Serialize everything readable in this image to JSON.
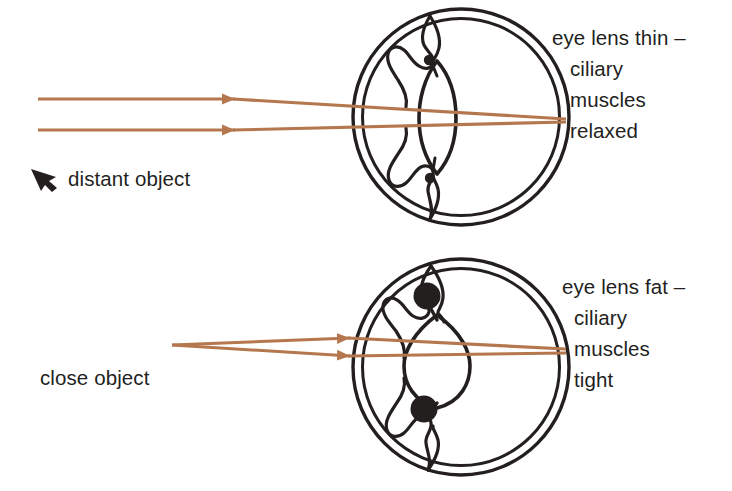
{
  "figure": {
    "background_color": "#ffffff",
    "ink_color": "#231f1e",
    "ray_color": "#b5784e"
  },
  "diagrams": [
    {
      "id": "distant-vision",
      "eye": {
        "center_x": 461,
        "center_y": 117,
        "radius_outer": 108,
        "radius_inner": 99
      },
      "lens": {
        "shape": "thin",
        "half_width": 19,
        "half_height": 56
      },
      "ciliary_dots": {
        "size": "small",
        "radius": 5,
        "top_y": 60,
        "bottom_y": 178
      },
      "rays": {
        "description": "parallel rays from distant object converging at retina",
        "type": "parallel",
        "entry_y_top": 99,
        "entry_y_bottom": 130,
        "focus_x": 566,
        "focus_y": 120,
        "start_x": 38
      },
      "object_label": {
        "text": "distant object",
        "marker": "arrow-up-left-icon"
      },
      "annotation_lines": [
        "eye lens thin –",
        "ciliary",
        "muscles",
        "relaxed"
      ]
    },
    {
      "id": "close-vision",
      "eye": {
        "center_x": 461,
        "center_y": 367,
        "radius_outer": 108,
        "radius_inner": 99
      },
      "lens": {
        "shape": "fat",
        "half_width": 33,
        "half_height": 56
      },
      "ciliary_dots": {
        "size": "large",
        "radius": 13,
        "top_y": 296,
        "bottom_y": 409
      },
      "rays": {
        "description": "diverging rays from close object converging at retina",
        "type": "diverging",
        "source_x": 172,
        "source_y": 345,
        "focus_x": 566,
        "focus_y": 352,
        "spread_y_top": 338,
        "spread_y_bottom": 356
      },
      "object_label": {
        "text": "close object",
        "marker": "none"
      },
      "annotation_lines": [
        "eye lens fat –",
        "ciliary",
        "muscles",
        "tight"
      ]
    }
  ],
  "labels": {
    "top_right": {
      "line1": "eye lens thin –",
      "line2": "ciliary",
      "line3": "muscles",
      "line4": "relaxed"
    },
    "bottom_right": {
      "line1": "eye lens fat –",
      "line2": "ciliary",
      "line3": "muscles",
      "line4": "tight"
    },
    "distant_object": "distant object",
    "close_object": "close object"
  }
}
